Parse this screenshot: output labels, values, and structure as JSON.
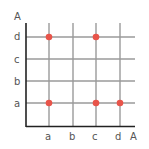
{
  "diagram": {
    "type": "relation-grid",
    "y_axis_label": "A",
    "x_axis_label": "A",
    "x_categories": [
      "a",
      "b",
      "c",
      "d"
    ],
    "y_categories": [
      "a",
      "b",
      "c",
      "d"
    ],
    "points": [
      {
        "x": "a",
        "y": "d"
      },
      {
        "x": "c",
        "y": "d"
      },
      {
        "x": "a",
        "y": "a"
      },
      {
        "x": "c",
        "y": "a"
      },
      {
        "x": "d",
        "y": "a"
      }
    ],
    "colors": {
      "grid": "#9a9a9a",
      "axis": "#222222",
      "point": "#e8544a",
      "label": "#555555"
    }
  }
}
